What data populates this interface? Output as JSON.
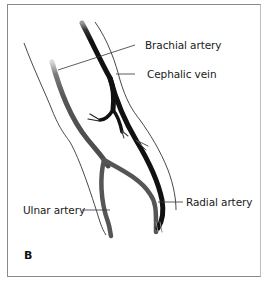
{
  "figure": {
    "panel_label": "B",
    "labels": {
      "brachial_artery": "Brachial artery",
      "cephalic_vein": "Cephalic vein",
      "ulnar_artery": "Ulnar artery",
      "radial_artery": "Radial  artery"
    },
    "colors": {
      "vein": "#111111",
      "artery": "#555555",
      "outline": "#333333",
      "frame": "#8a8a8a",
      "background": "#ffffff"
    }
  }
}
